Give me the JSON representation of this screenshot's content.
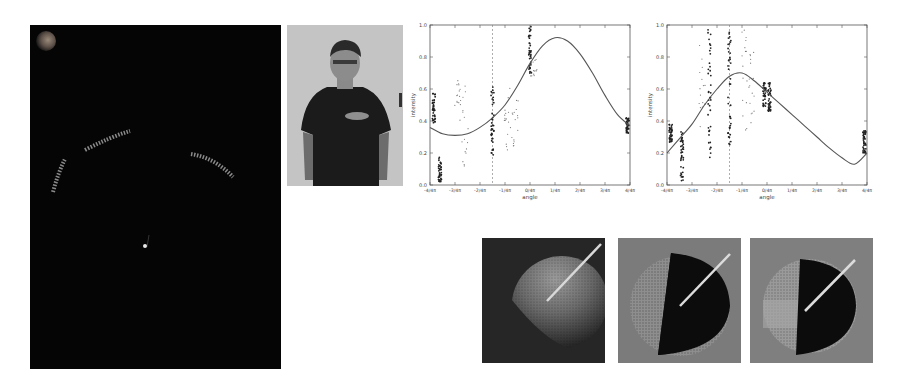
{
  "figure": {
    "panels": [
      {
        "id": "dark-panel",
        "kind": "rendered-scene",
        "description": "dark scene with three curved dotted arcs, a small bright point and a dim sphere in top-left corner"
      },
      {
        "id": "photo-panel",
        "kind": "photo",
        "description": "person standing in dark t-shirt against light wall"
      },
      {
        "id": "chart-1",
        "kind": "chart"
      },
      {
        "id": "chart-2",
        "kind": "chart"
      },
      {
        "id": "sphere-1",
        "kind": "rendered-sphere",
        "description": "lit hemisphere on dark background with light direction line"
      },
      {
        "id": "sphere-2",
        "kind": "rendered-sphere",
        "description": "half-dark sphere on gray background with light direction line"
      },
      {
        "id": "sphere-3",
        "kind": "rendered-sphere",
        "description": "half-dark sphere on gray background with light direction line"
      }
    ]
  },
  "chart_data": [
    {
      "type": "scatter",
      "title": "",
      "xlabel": "angle",
      "ylabel": "intensity",
      "xlim": [
        -4,
        4
      ],
      "ylim": [
        0.0,
        1.0
      ],
      "x_unit": "pi/4",
      "xtick_labels": [
        "-4/4π",
        "-3/4π",
        "-2/4π",
        "-1/4π",
        "0/4π",
        "1/4π",
        "2/4π",
        "3/4π",
        "4/4π"
      ],
      "ytick_labels": [
        "0.0",
        "0.2",
        "0.4",
        "0.6",
        "0.8",
        "1.0"
      ],
      "grid": false,
      "dashed_vline_x": -1.5,
      "fit_curve": {
        "x": [
          -4,
          -3.5,
          -3,
          -2.5,
          -2,
          -1.5,
          -1,
          -0.5,
          0,
          0.5,
          1,
          1.5,
          2,
          2.5,
          3,
          3.5,
          4
        ],
        "y": [
          0.36,
          0.32,
          0.31,
          0.32,
          0.36,
          0.42,
          0.5,
          0.62,
          0.76,
          0.87,
          0.92,
          0.9,
          0.82,
          0.7,
          0.56,
          0.44,
          0.37
        ]
      },
      "scatter_clusters": [
        {
          "x": -3.85,
          "y_range": [
            0.38,
            0.58
          ],
          "dense": true
        },
        {
          "x": -3.6,
          "y_range": [
            0.02,
            0.19
          ],
          "dense": true
        },
        {
          "x": -2.9,
          "y_range": [
            0.37,
            0.66
          ],
          "dense": false
        },
        {
          "x": -2.6,
          "y_range": [
            0.1,
            0.64
          ],
          "dense": false
        },
        {
          "x": -1.5,
          "y_range": [
            0.16,
            0.63
          ],
          "dense": true
        },
        {
          "x": -0.9,
          "y_range": [
            0.22,
            0.62
          ],
          "dense": false
        },
        {
          "x": -0.6,
          "y_range": [
            0.24,
            0.58
          ],
          "dense": false
        },
        {
          "x": 0.0,
          "y_range": [
            0.7,
            1.0
          ],
          "dense": true
        },
        {
          "x": 0.15,
          "y_range": [
            0.68,
            0.82
          ],
          "dense": false
        },
        {
          "x": 3.9,
          "y_range": [
            0.32,
            0.42
          ],
          "dense": true
        }
      ]
    },
    {
      "type": "scatter",
      "title": "",
      "xlabel": "angle",
      "ylabel": "intensity",
      "xlim": [
        -4,
        4
      ],
      "ylim": [
        0.0,
        1.0
      ],
      "x_unit": "pi/4",
      "xtick_labels": [
        "-4/4π",
        "-3/4π",
        "-2/4π",
        "-1/4π",
        "0/4π",
        "1/4π",
        "2/4π",
        "3/4π",
        "4/4π"
      ],
      "ytick_labels": [
        "0.0",
        "0.2",
        "0.4",
        "0.6",
        "0.8",
        "1.0"
      ],
      "grid": false,
      "dashed_vline_x": -1.5,
      "fit_curve": {
        "x": [
          -4,
          -3.5,
          -3,
          -2.5,
          -2,
          -1.5,
          -1,
          -0.5,
          0,
          0.5,
          1,
          1.5,
          2,
          2.5,
          3,
          3.5,
          4
        ],
        "y": [
          0.2,
          0.29,
          0.38,
          0.5,
          0.6,
          0.68,
          0.7,
          0.65,
          0.58,
          0.51,
          0.44,
          0.37,
          0.3,
          0.23,
          0.17,
          0.13,
          0.2
        ]
      },
      "scatter_clusters": [
        {
          "x": -3.85,
          "y_range": [
            0.26,
            0.38
          ],
          "dense": true
        },
        {
          "x": -3.4,
          "y_range": [
            0.02,
            0.34
          ],
          "dense": true
        },
        {
          "x": -2.6,
          "y_range": [
            0.35,
            0.92
          ],
          "dense": false
        },
        {
          "x": -2.3,
          "y_range": [
            0.15,
            0.98
          ],
          "dense": true
        },
        {
          "x": -1.5,
          "y_range": [
            0.25,
            0.96
          ],
          "dense": true
        },
        {
          "x": -0.9,
          "y_range": [
            0.34,
            0.98
          ],
          "dense": false
        },
        {
          "x": -0.6,
          "y_range": [
            0.38,
            0.86
          ],
          "dense": false
        },
        {
          "x": -0.1,
          "y_range": [
            0.48,
            0.64
          ],
          "dense": true
        },
        {
          "x": 0.1,
          "y_range": [
            0.46,
            0.64
          ],
          "dense": true
        },
        {
          "x": 3.9,
          "y_range": [
            0.2,
            0.34
          ],
          "dense": true
        }
      ]
    }
  ]
}
